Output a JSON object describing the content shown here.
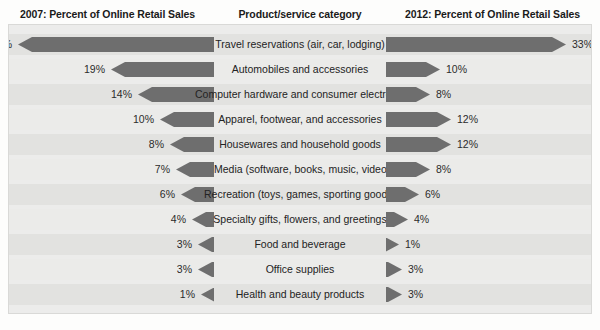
{
  "header": {
    "left": "2007: Percent of Online Retail Sales",
    "middle": "Product/service category",
    "right": "2012: Percent of Online Retail Sales"
  },
  "colors": {
    "bar": "#6e6e6e",
    "panel": "#ececeb",
    "band": "#e2e2e0",
    "band_alt": "#ebebe9",
    "text": "#232323"
  },
  "chart_data": {
    "type": "bar",
    "xlabel": "",
    "ylabel": "Product/service category",
    "orientation": "horizontal-diverging",
    "grid": false,
    "legend_position": "top",
    "xlim": [
      0,
      36
    ],
    "categories": [
      "Travel reservations (air, car, lodging)",
      "Automobiles and accessories",
      "Computer hardware and consumer electronics",
      "Apparel, footwear, and accessories",
      "Housewares and household goods",
      "Media (software, books, music, video)",
      "Recreation (toys, games, sporting goods)",
      "Specialty gifts, flowers, and greetings",
      "Food and beverage",
      "Office supplies",
      "Health and beauty products"
    ],
    "series": [
      {
        "name": "2007: Percent of Online Retail Sales",
        "values": [
          36,
          19,
          14,
          10,
          8,
          7,
          6,
          4,
          3,
          3,
          1
        ],
        "labels": [
          "36%",
          "19%",
          "14%",
          "10%",
          "8%",
          "7%",
          "6%",
          "4%",
          "3%",
          "3%",
          "1%"
        ]
      },
      {
        "name": "2012: Percent of Online Retail Sales",
        "values": [
          33,
          10,
          8,
          12,
          12,
          8,
          6,
          4,
          1,
          3,
          3
        ],
        "labels": [
          "33%",
          "10%",
          "8%",
          "12%",
          "12%",
          "8%",
          "6%",
          "4%",
          "1%",
          "3%",
          "3%"
        ]
      }
    ]
  }
}
